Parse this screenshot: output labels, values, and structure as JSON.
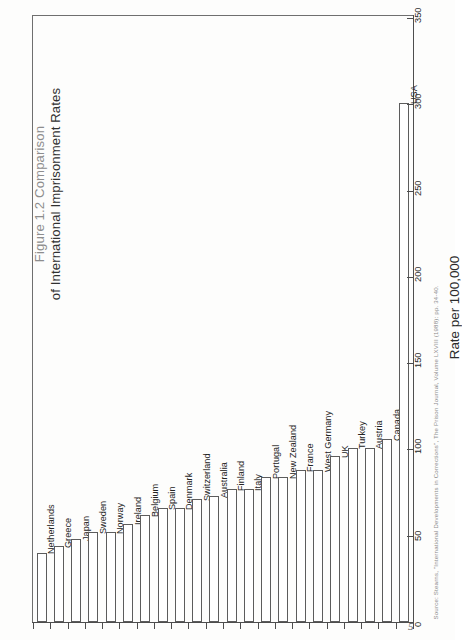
{
  "figure": {
    "title_line1": "Figure 1.2 Comparison",
    "title_line2": "of International Imprisonment Rates",
    "page_number": "5",
    "source_note": "Source: Stearns, \"International Developments in Corrections\", The Prison Journal, Volume LXVIII (1988): pp. 34-40."
  },
  "chart_data": {
    "type": "bar",
    "orientation": "horizontal",
    "title": "Figure 1.2 Comparison of International Imprisonment Rates",
    "xlabel": "Rate per 100,000",
    "ylabel": "",
    "xlim": [
      0,
      350
    ],
    "ticks": [
      0,
      50,
      100,
      150,
      200,
      250,
      300,
      350
    ],
    "grid": false,
    "legend": false,
    "categories": [
      "Netherlands",
      "Greece",
      "Japan",
      "Sweden",
      "Norway",
      "Ireland",
      "Belgium",
      "Spain",
      "Denmark",
      "Switzerland",
      "Australia",
      "Finland",
      "Italy",
      "Portugal",
      "New Zealand",
      "France",
      "West Germany",
      "UK",
      "Turkey",
      "Austria",
      "Canada",
      "USA"
    ],
    "values": [
      40,
      44,
      48,
      52,
      52,
      57,
      62,
      66,
      66,
      71,
      73,
      77,
      77,
      84,
      84,
      88,
      88,
      96,
      101,
      101,
      106,
      301
    ],
    "bar_fill": "#ffffff",
    "bar_stroke": "#5c5c5c"
  }
}
